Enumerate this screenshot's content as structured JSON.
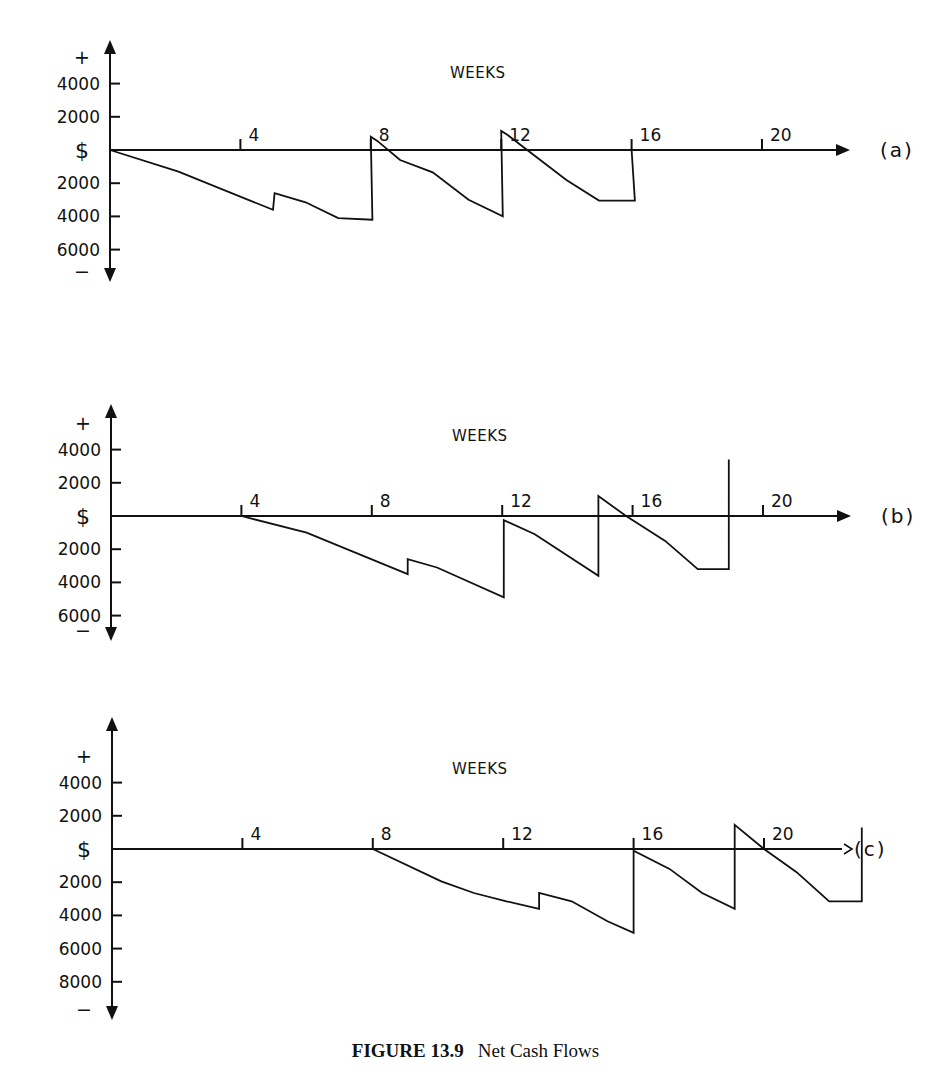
{
  "figure": {
    "number_label": "FIGURE 13.9",
    "title": "Net Cash Flows"
  },
  "layout": {
    "week_px": 32.6,
    "dollar_px_per_2000": 33.2,
    "x_axis_length_weeks": 22.7,
    "panels": [
      {
        "id": "a",
        "x0": 110,
        "y0": 150,
        "top": 40,
        "bottom": 282,
        "weeks_label_x": 450,
        "weeks_label_y": 78
      },
      {
        "id": "b",
        "x0": 111,
        "y0": 516,
        "top": 404,
        "bottom": 641,
        "weeks_label_x": 452,
        "weeks_label_y": 441
      },
      {
        "id": "c",
        "x0": 112,
        "y0": 849,
        "top": 717,
        "bottom": 1020,
        "weeks_label_x": 452,
        "weeks_label_y": 774
      }
    ]
  },
  "chart_data": [
    {
      "type": "line",
      "panel": "(a)",
      "title": "",
      "xlabel": "WEEKS",
      "ylabel": "$",
      "y_positive_label": "+",
      "y_negative_label": "−",
      "x_ticks": [
        4,
        8,
        12,
        16,
        20
      ],
      "y_ticks_positive": [
        4000,
        2000
      ],
      "y_ticks_negative": [
        2000,
        4000,
        6000
      ],
      "xlim": [
        0,
        22.7
      ],
      "ylim": [
        -7500,
        5500
      ],
      "grid": false,
      "series": [
        {
          "name": "Net cash flow (a)",
          "x": [
            0,
            2.1,
            5.0,
            5.05,
            6.0,
            7.0,
            8.05,
            8.0,
            8.2,
            8.9,
            9.9,
            11.0,
            12.05,
            12.0,
            12.2,
            14.0,
            15.0,
            16.1,
            16.0
          ],
          "y": [
            0,
            -1300,
            -3600,
            -2600,
            -3150,
            -4100,
            -4200,
            800,
            550,
            -600,
            -1350,
            -3000,
            -4000,
            1150,
            900,
            -1800,
            -3050,
            -3050,
            0
          ]
        }
      ]
    },
    {
      "type": "line",
      "panel": "(b)",
      "title": "",
      "xlabel": "WEEKS",
      "ylabel": "$",
      "y_positive_label": "+",
      "y_negative_label": "−",
      "x_ticks": [
        4,
        8,
        12,
        16,
        20
      ],
      "y_ticks_positive": [
        4000,
        2000
      ],
      "y_ticks_negative": [
        2000,
        4000,
        6000
      ],
      "xlim": [
        0,
        22.7
      ],
      "ylim": [
        -7500,
        6500
      ],
      "grid": false,
      "series": [
        {
          "name": "Net cash flow (b)",
          "x": [
            4.0,
            6.0,
            9.1,
            9.1,
            10.0,
            12.05,
            12.05,
            13.0,
            14.95,
            14.95,
            15.8,
            17.0,
            18.0,
            18.95,
            18.95
          ],
          "y": [
            0,
            -1000,
            -3500,
            -2600,
            -3100,
            -4900,
            -250,
            -1100,
            -3600,
            1200,
            0,
            -1500,
            -3200,
            -3200,
            3400
          ]
        }
      ]
    },
    {
      "type": "line",
      "panel": "(c)",
      "title": "",
      "xlabel": "WEEKS",
      "ylabel": "$",
      "y_positive_label": "+",
      "y_negative_label": "−",
      "x_ticks": [
        4,
        8,
        12,
        16,
        20
      ],
      "y_ticks_positive": [
        4000,
        2000
      ],
      "y_ticks_negative": [
        2000,
        4000,
        6000,
        8000
      ],
      "xlim": [
        0,
        22.7
      ],
      "ylim": [
        -9500,
        6500
      ],
      "grid": false,
      "series": [
        {
          "name": "Net cash flow (c)",
          "x": [
            8.0,
            10.1,
            11.1,
            12.1,
            13.1,
            13.1,
            14.1,
            15.2,
            16.0,
            16.0,
            17.1,
            18.1,
            19.1,
            19.1,
            20.0,
            21.0,
            22.0,
            23.0,
            23.0
          ],
          "y": [
            0,
            -1950,
            -2650,
            -3150,
            -3600,
            -2650,
            -3150,
            -4350,
            -5050,
            -100,
            -1200,
            -2650,
            -3600,
            1450,
            0,
            -1400,
            -3150,
            -3150,
            1300
          ]
        }
      ]
    }
  ]
}
